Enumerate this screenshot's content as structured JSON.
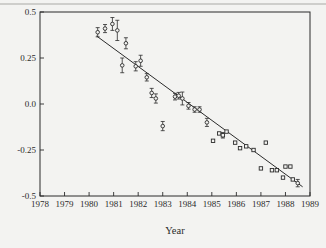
{
  "figure": {
    "background": "#f3f3f1",
    "ink": "#2b2b2b",
    "marker_fill": "#f3f3f1"
  },
  "chart_data": {
    "type": "scatter",
    "title": "",
    "xlabel": "Year",
    "ylabel": "",
    "xlim": [
      1978,
      1989
    ],
    "ylim": [
      -0.5,
      0.5
    ],
    "x_tick_labels": [
      "1978",
      "1979",
      "1980",
      "1981",
      "1982",
      "1983",
      "1984",
      "1985",
      "1986",
      "1987",
      "1988",
      "1989"
    ],
    "x_ticks": [
      1978,
      1979,
      1980,
      1981,
      1982,
      1983,
      1984,
      1985,
      1986,
      1987,
      1988,
      1989
    ],
    "y_ticks": [
      0.5,
      0.25,
      0.0,
      -0.25,
      -0.5
    ],
    "y_tick_labels": [
      "0.5",
      "0.25",
      "0.0",
      "-0.25",
      "-0.5"
    ],
    "grid": false,
    "legend": null,
    "trend_line": {
      "x1": 1980.3,
      "y1": 0.37,
      "x2": 1988.7,
      "y2": -0.45
    },
    "points": [
      {
        "x": 1980.35,
        "y": 0.39,
        "err": 0.025,
        "marker": "circle"
      },
      {
        "x": 1980.65,
        "y": 0.41,
        "err": 0.022,
        "marker": "circle"
      },
      {
        "x": 1980.95,
        "y": 0.435,
        "err": 0.035,
        "marker": "circle"
      },
      {
        "x": 1981.15,
        "y": 0.4,
        "err": 0.055,
        "marker": "circle"
      },
      {
        "x": 1981.35,
        "y": 0.21,
        "err": 0.04,
        "marker": "circle"
      },
      {
        "x": 1981.5,
        "y": 0.33,
        "err": 0.03,
        "marker": "circle"
      },
      {
        "x": 1981.9,
        "y": 0.205,
        "err": 0.025,
        "marker": "circle"
      },
      {
        "x": 1982.1,
        "y": 0.235,
        "err": 0.03,
        "marker": "circle"
      },
      {
        "x": 1982.35,
        "y": 0.145,
        "err": 0.02,
        "marker": "circle"
      },
      {
        "x": 1982.55,
        "y": 0.06,
        "err": 0.025,
        "marker": "circle"
      },
      {
        "x": 1982.72,
        "y": 0.03,
        "err": 0.025,
        "marker": "circle"
      },
      {
        "x": 1983.0,
        "y": -0.12,
        "err": 0.025,
        "marker": "circle"
      },
      {
        "x": 1983.5,
        "y": 0.04,
        "err": 0.018,
        "marker": "circle"
      },
      {
        "x": 1983.65,
        "y": 0.045,
        "err": 0.018,
        "marker": "circle"
      },
      {
        "x": 1983.8,
        "y": 0.03,
        "err": 0.035,
        "marker": "circle"
      },
      {
        "x": 1984.05,
        "y": -0.01,
        "err": 0.018,
        "marker": "circle"
      },
      {
        "x": 1984.3,
        "y": -0.03,
        "err": 0.015,
        "marker": "circle"
      },
      {
        "x": 1984.5,
        "y": -0.03,
        "err": 0.015,
        "marker": "circle"
      },
      {
        "x": 1984.8,
        "y": -0.1,
        "err": 0.022,
        "marker": "circle"
      },
      {
        "x": 1985.05,
        "y": -0.2,
        "err": 0,
        "marker": "square"
      },
      {
        "x": 1985.3,
        "y": -0.16,
        "err": 0,
        "marker": "square"
      },
      {
        "x": 1985.45,
        "y": -0.17,
        "err": 0.015,
        "marker": "square"
      },
      {
        "x": 1985.6,
        "y": -0.15,
        "err": 0,
        "marker": "square"
      },
      {
        "x": 1985.95,
        "y": -0.21,
        "err": 0,
        "marker": "square"
      },
      {
        "x": 1986.15,
        "y": -0.24,
        "err": 0,
        "marker": "square"
      },
      {
        "x": 1986.4,
        "y": -0.23,
        "err": 0,
        "marker": "square"
      },
      {
        "x": 1986.7,
        "y": -0.25,
        "err": 0,
        "marker": "square"
      },
      {
        "x": 1987.0,
        "y": -0.35,
        "err": 0,
        "marker": "square"
      },
      {
        "x": 1987.2,
        "y": -0.21,
        "err": 0,
        "marker": "square"
      },
      {
        "x": 1987.45,
        "y": -0.36,
        "err": 0,
        "marker": "square"
      },
      {
        "x": 1987.65,
        "y": -0.36,
        "err": 0,
        "marker": "square"
      },
      {
        "x": 1987.9,
        "y": -0.4,
        "err": 0,
        "marker": "square"
      },
      {
        "x": 1988.0,
        "y": -0.34,
        "err": 0,
        "marker": "square"
      },
      {
        "x": 1988.2,
        "y": -0.34,
        "err": 0,
        "marker": "square"
      },
      {
        "x": 1988.3,
        "y": -0.41,
        "err": 0,
        "marker": "square"
      },
      {
        "x": 1988.5,
        "y": -0.43,
        "err": 0.02,
        "marker": "circle"
      }
    ],
    "plot_area": {
      "left": 40,
      "right": 310,
      "top": 12,
      "bottom": 196
    }
  }
}
